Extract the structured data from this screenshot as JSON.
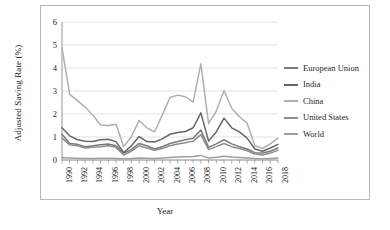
{
  "chart_data": {
    "type": "line",
    "title": "",
    "xlabel": "Year",
    "ylabel": "Adjusted Saving Rate (%)",
    "xlim": [
      1990,
      2018
    ],
    "ylim": [
      0,
      6
    ],
    "yticks": [
      "0",
      "1",
      "2",
      "3",
      "4",
      "5",
      "6"
    ],
    "xticks": [
      "1990",
      "1992",
      "1994",
      "1996",
      "1998",
      "2000",
      "2002",
      "2004",
      "2006",
      "2008",
      "2010",
      "2012",
      "2014",
      "2016",
      "2018"
    ],
    "grid": "horizontal",
    "legend_position": "right",
    "x": [
      1990,
      1991,
      1992,
      1993,
      1994,
      1995,
      1996,
      1997,
      1998,
      1999,
      2000,
      2001,
      2002,
      2003,
      2004,
      2005,
      2006,
      2007,
      2008,
      2009,
      2010,
      2011,
      2012,
      2013,
      2014,
      2015,
      2016,
      2017,
      2018
    ],
    "series": [
      {
        "name": "European Union",
        "color": "#7a7a7a",
        "values": [
          1.12,
          0.72,
          0.68,
          0.58,
          0.62,
          0.66,
          0.7,
          0.62,
          0.3,
          0.45,
          0.72,
          0.62,
          0.48,
          0.58,
          0.72,
          0.8,
          0.88,
          0.95,
          1.3,
          0.55,
          0.7,
          0.88,
          0.7,
          0.58,
          0.48,
          0.32,
          0.3,
          0.38,
          0.52
        ]
      },
      {
        "name": "India",
        "color": "#666666",
        "values": [
          1.4,
          1.05,
          0.88,
          0.82,
          0.8,
          0.88,
          0.9,
          0.8,
          0.32,
          0.62,
          1.02,
          0.8,
          0.78,
          0.92,
          1.12,
          1.2,
          1.24,
          1.4,
          2.05,
          0.82,
          1.22,
          1.82,
          1.4,
          1.22,
          0.95,
          0.48,
          0.38,
          0.52,
          0.68
        ]
      },
      {
        "name": "China",
        "color": "#b0b0b0",
        "values": [
          4.88,
          2.85,
          2.58,
          2.3,
          1.95,
          1.52,
          1.5,
          1.55,
          0.58,
          1.02,
          1.72,
          1.4,
          1.22,
          1.95,
          2.72,
          2.82,
          2.75,
          2.52,
          4.18,
          1.58,
          2.12,
          3.02,
          2.25,
          1.88,
          1.6,
          0.62,
          0.5,
          0.7,
          0.95
        ]
      },
      {
        "name": "United States",
        "color": "#8d8d8d",
        "values": [
          0.95,
          0.66,
          0.62,
          0.52,
          0.55,
          0.58,
          0.62,
          0.55,
          0.22,
          0.38,
          0.62,
          0.52,
          0.42,
          0.5,
          0.62,
          0.7,
          0.75,
          0.82,
          1.1,
          0.45,
          0.58,
          0.72,
          0.58,
          0.5,
          0.4,
          0.26,
          0.22,
          0.3,
          0.42
        ]
      },
      {
        "name": "World",
        "color": "#9e9e9e",
        "values": [
          0.1,
          0.09,
          0.08,
          0.07,
          0.07,
          0.08,
          0.08,
          0.07,
          0.05,
          0.06,
          0.09,
          0.08,
          0.07,
          0.09,
          0.11,
          0.13,
          0.14,
          0.15,
          0.2,
          0.09,
          0.12,
          0.16,
          0.13,
          0.11,
          0.09,
          0.06,
          0.05,
          0.07,
          0.09
        ]
      }
    ]
  },
  "axes": {
    "y_title": "Adjusted Saving Rate (%)",
    "x_title": "Year"
  },
  "legend": {
    "items": [
      {
        "label": "European Union"
      },
      {
        "label": "India"
      },
      {
        "label": "China"
      },
      {
        "label": "United States"
      },
      {
        "label": "World"
      }
    ]
  },
  "style": {
    "grid_color": "#d6d6d6",
    "axis_color": "#8a8a8a",
    "frame_color": "#b9b9b9",
    "background": "#ffffff"
  }
}
